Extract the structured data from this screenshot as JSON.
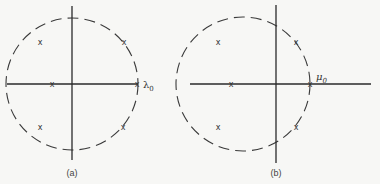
{
  "figure": {
    "panels": [
      {
        "id": "a",
        "caption": "(a)",
        "point_label": "λ",
        "point_label_sub": "0",
        "circle": {
          "cx": 72,
          "cy": 84,
          "r": 66
        },
        "v_axis": {
          "x": 72,
          "y1": 6,
          "y2": 160
        },
        "h_axis": {
          "y": 84,
          "x1": 7,
          "x2": 138
        },
        "marks": [
          {
            "x": 40,
            "y": 42
          },
          {
            "x": 124,
            "y": 42
          },
          {
            "x": 52,
            "y": 84
          },
          {
            "x": 137,
            "y": 84
          },
          {
            "x": 40,
            "y": 127
          },
          {
            "x": 123,
            "y": 127
          }
        ]
      },
      {
        "id": "b",
        "caption": "(b)",
        "point_label": "μ",
        "point_label_sub": "0",
        "circle": {
          "cx": 243,
          "cy": 84,
          "r": 67
        },
        "v_axis": {
          "x": 276,
          "y1": 5,
          "y2": 163
        },
        "h_axis": {
          "y": 84,
          "x1": 190,
          "x2": 371
        },
        "marks": [
          {
            "x": 218,
            "y": 42
          },
          {
            "x": 296,
            "y": 42
          },
          {
            "x": 231,
            "y": 84
          },
          {
            "x": 310,
            "y": 84
          },
          {
            "x": 218,
            "y": 127
          },
          {
            "x": 296,
            "y": 127
          }
        ]
      }
    ],
    "mark_glyph": "x"
  }
}
